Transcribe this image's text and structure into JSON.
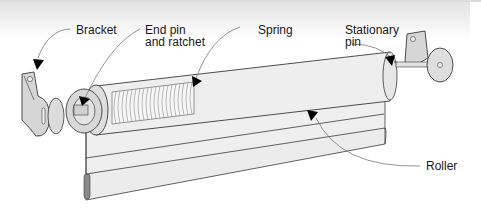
{
  "diagram": {
    "labels": {
      "bracket": "Bracket",
      "end_pin_line1": "End pin",
      "end_pin_line2": "and ratchet",
      "spring": "Spring",
      "stationary_line1": "Stationary",
      "stationary_line2": "pin",
      "roller": "Roller"
    },
    "colors": {
      "part_fill": "#dcdcdc",
      "shade_fill": "#efefef",
      "outline": "#3a3a3a",
      "leader": "#777777",
      "arrow": "#000000",
      "bottom_bar": "#8a8a8a"
    }
  }
}
